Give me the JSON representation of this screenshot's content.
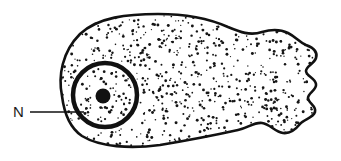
{
  "figure": {
    "background_color": "#ffffff",
    "ink_color": "#111111",
    "canvas": {
      "width": 341,
      "height": 161
    }
  },
  "labels": [
    {
      "id": "nucleus",
      "text": "N",
      "meaning": "nucleus",
      "x": 13,
      "y": 117,
      "leader_line": {
        "x1": 30,
        "y1": 112,
        "x2": 84,
        "y2": 112
      }
    }
  ],
  "cell": {
    "name": "cell-outline",
    "outline_stroke_width": 2.6,
    "fill": "#ffffff",
    "stipple": {
      "dot_color": "#151515",
      "dot_count": 620,
      "dot_radius_min": 0.6,
      "dot_radius_max": 1.5
    },
    "shape_description": "rounded bulbous left body narrowing to a waist, ending in a frilled scalloped right tail"
  },
  "nucleus": {
    "name": "nucleus",
    "center_x": 105,
    "center_y": 95,
    "radius": 32,
    "stroke_width": 4.5,
    "stroke_color": "#111111",
    "fill": "#ffffff",
    "stipple_dot_count": 70,
    "nucleolus": {
      "name": "nucleolus",
      "center_x": 103,
      "center_y": 96,
      "radius": 7.5,
      "fill": "#111111"
    }
  }
}
